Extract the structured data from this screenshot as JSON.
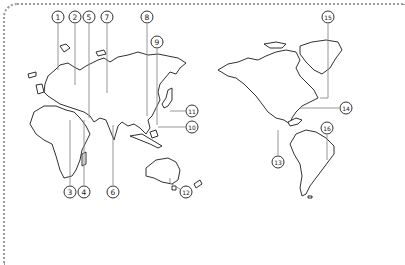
{
  "map": {
    "projection": "pacific-centered world outline",
    "line_color": "#1a1a1a",
    "leader_color": "#8a8a8a",
    "border_color": "#9a9a9a",
    "callouts": [
      {
        "label": "1",
        "x": 58,
        "y": 17,
        "line": [
          [
            58,
            24
          ],
          [
            58,
            70
          ]
        ]
      },
      {
        "label": "2",
        "x": 75,
        "y": 17,
        "line": [
          [
            75,
            24
          ],
          [
            75,
            85
          ]
        ]
      },
      {
        "label": "5",
        "x": 89,
        "y": 17,
        "line": [
          [
            89,
            24
          ],
          [
            89,
            118
          ]
        ]
      },
      {
        "label": "7",
        "x": 107,
        "y": 17,
        "line": [
          [
            107,
            24
          ],
          [
            107,
            93
          ]
        ]
      },
      {
        "label": "8",
        "x": 147,
        "y": 17,
        "line": [
          [
            147,
            24
          ],
          [
            147,
            116
          ]
        ]
      },
      {
        "label": "9",
        "x": 157,
        "y": 42,
        "line": [
          [
            157,
            49
          ],
          [
            157,
            125
          ]
        ]
      },
      {
        "label": "11",
        "x": 192,
        "y": 111,
        "line": [
          [
            185,
            111
          ],
          [
            170,
            111
          ]
        ]
      },
      {
        "label": "10",
        "x": 192,
        "y": 127,
        "line": [
          [
            185,
            127
          ],
          [
            158,
            127
          ]
        ]
      },
      {
        "label": "3",
        "x": 70,
        "y": 192,
        "line": [
          [
            70,
            185
          ],
          [
            70,
            120
          ]
        ]
      },
      {
        "label": "4",
        "x": 84,
        "y": 192,
        "line": [
          [
            84,
            185
          ],
          [
            84,
            120
          ]
        ]
      },
      {
        "label": "6",
        "x": 113,
        "y": 192,
        "line": [
          [
            113,
            185
          ],
          [
            113,
            125
          ]
        ]
      },
      {
        "label": "12",
        "x": 186,
        "y": 192,
        "line": [
          [
            180,
            189
          ],
          [
            170,
            183
          ],
          [
            170,
            178
          ]
        ]
      },
      {
        "label": "13",
        "x": 278,
        "y": 162,
        "line": [
          [
            278,
            155
          ],
          [
            278,
            130
          ]
        ]
      },
      {
        "label": "14",
        "x": 346,
        "y": 108,
        "line": [
          [
            339,
            108
          ],
          [
            300,
            108
          ]
        ]
      },
      {
        "label": "15",
        "x": 328,
        "y": 17,
        "line": [
          [
            328,
            24
          ],
          [
            328,
            98
          ],
          [
            320,
            98
          ]
        ]
      },
      {
        "label": "16",
        "x": 327,
        "y": 128,
        "line": [
          [
            327,
            135
          ],
          [
            327,
            160
          ]
        ]
      }
    ]
  }
}
